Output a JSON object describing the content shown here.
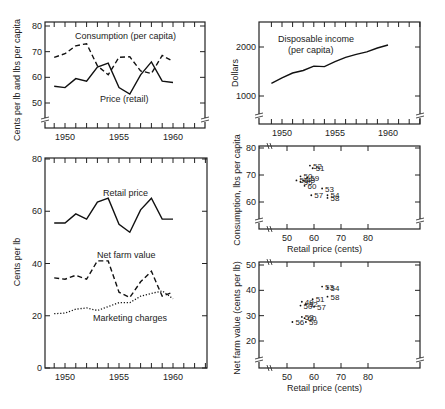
{
  "chart_data": [
    {
      "id": "consumption_price",
      "type": "line",
      "title": "",
      "xlabel": "",
      "ylabel": "Cents per lb and lbs per capita",
      "x": [
        1949,
        1950,
        1951,
        1952,
        1953,
        1954,
        1955,
        1956,
        1957,
        1958,
        1959,
        1960
      ],
      "xticks": [
        1950,
        1955,
        1960
      ],
      "yticks": [
        50,
        60,
        70,
        80
      ],
      "ylim": [
        40,
        80
      ],
      "xlim": [
        1948,
        1963
      ],
      "series": [
        {
          "name": "Consumption (per capita)",
          "style": "dashed",
          "values": [
            67.8,
            69.2,
            72.3,
            73.1,
            64.5,
            61.0,
            67.8,
            68.0,
            62.5,
            61.5,
            68.5,
            66.2
          ]
        },
        {
          "name": "Price (retail)",
          "style": "solid",
          "values": [
            56.5,
            56.0,
            59.5,
            58.5,
            64.0,
            65.5,
            56.0,
            53.5,
            61.0,
            66.0,
            58.5,
            58.0
          ]
        }
      ],
      "annotations": [
        "Consumption (per capita)",
        "Price (retail)"
      ]
    },
    {
      "id": "disposable_income",
      "type": "line",
      "title": "",
      "xlabel": "",
      "ylabel": "Dollars",
      "x": [
        1949,
        1950,
        1951,
        1952,
        1953,
        1954,
        1955,
        1956,
        1957,
        1958,
        1959,
        1960
      ],
      "xticks": [
        1950,
        1955,
        1960
      ],
      "yticks": [
        1000,
        2000
      ],
      "ylim": [
        500,
        2500
      ],
      "xlim": [
        1948,
        1963
      ],
      "series": [
        {
          "name": "Disposable income (per capita)",
          "style": "solid",
          "values": [
            1260,
            1370,
            1470,
            1520,
            1610,
            1600,
            1700,
            1790,
            1850,
            1900,
            1980,
            2040
          ]
        }
      ],
      "annotations": [
        "Disposable income",
        "(per capita)"
      ]
    },
    {
      "id": "price_spread",
      "type": "line",
      "title": "",
      "xlabel": "",
      "ylabel": "Cents per lb",
      "x": [
        1949,
        1950,
        1951,
        1952,
        1953,
        1954,
        1955,
        1956,
        1957,
        1958,
        1959,
        1960
      ],
      "xticks": [
        1950,
        1955,
        1960
      ],
      "yticks": [
        0,
        20,
        40,
        60,
        80
      ],
      "ylim": [
        0,
        80
      ],
      "xlim": [
        1948,
        1963
      ],
      "series": [
        {
          "name": "Retail price",
          "style": "solid",
          "values": [
            55.5,
            55.5,
            59.0,
            57.0,
            63.5,
            65.0,
            55.0,
            52.0,
            60.5,
            65.0,
            57.0,
            57.0
          ]
        },
        {
          "name": "Net farm value",
          "style": "dashed",
          "values": [
            34.5,
            34.0,
            35.5,
            34.0,
            41.0,
            41.0,
            29.0,
            27.0,
            33.0,
            37.0,
            27.5,
            29.0
          ]
        },
        {
          "name": "Marketing charges",
          "style": "dotted",
          "values": [
            20.8,
            21.0,
            22.5,
            23.0,
            22.0,
            23.5,
            25.0,
            25.0,
            27.5,
            28.5,
            29.5,
            26.5
          ]
        }
      ],
      "annotations": [
        "Retail price",
        "Net farm value",
        "Marketing charges"
      ]
    },
    {
      "id": "consumption_vs_price",
      "type": "scatter",
      "title": "",
      "xlabel": "Retail price (cents)",
      "ylabel": "Consumption, lbs per capita",
      "xticks": [
        50,
        60,
        70,
        80
      ],
      "yticks": [
        60,
        70,
        80
      ],
      "xlim": [
        40,
        100
      ],
      "ylim": [
        50,
        80
      ],
      "points": [
        {
          "label": "49",
          "x": 56.0,
          "y": 68.0
        },
        {
          "label": "50",
          "x": 55.0,
          "y": 69.5
        },
        {
          "label": "51",
          "x": 59.5,
          "y": 72.5
        },
        {
          "label": "52",
          "x": 58.5,
          "y": 73.5
        },
        {
          "label": "53",
          "x": 63.0,
          "y": 65.0
        },
        {
          "label": "54",
          "x": 65.0,
          "y": 62.5
        },
        {
          "label": "55",
          "x": 55.0,
          "y": 67.5
        },
        {
          "label": "56",
          "x": 53.5,
          "y": 68.0
        },
        {
          "label": "57",
          "x": 59.0,
          "y": 62.5
        },
        {
          "label": "58",
          "x": 65.0,
          "y": 61.5
        },
        {
          "label": "59",
          "x": 57.5,
          "y": 69.0
        },
        {
          "label": "60",
          "x": 56.5,
          "y": 66.0
        }
      ]
    },
    {
      "id": "farmvalue_vs_price",
      "type": "scatter",
      "title": "",
      "xlabel": "Retail price (cents)",
      "ylabel": "Net farm value (cents per lb)",
      "xticks": [
        50,
        60,
        70,
        80
      ],
      "yticks": [
        20,
        30,
        40,
        50
      ],
      "xlim": [
        40,
        100
      ],
      "ylim": [
        10,
        50
      ],
      "points": [
        {
          "label": "49",
          "x": 55.5,
          "y": 35.5
        },
        {
          "label": "50",
          "x": 55.0,
          "y": 34.0
        },
        {
          "label": "51",
          "x": 59.5,
          "y": 36.5
        },
        {
          "label": "52",
          "x": 57.0,
          "y": 34.5
        },
        {
          "label": "53",
          "x": 63.0,
          "y": 41.5
        },
        {
          "label": "54",
          "x": 65.0,
          "y": 41.0
        },
        {
          "label": "56",
          "x": 52.0,
          "y": 27.5
        },
        {
          "label": "57",
          "x": 60.0,
          "y": 33.5
        },
        {
          "label": "58",
          "x": 65.0,
          "y": 37.5
        },
        {
          "label": "59",
          "x": 57.0,
          "y": 27.5
        },
        {
          "label": "60",
          "x": 56.5,
          "y": 29.0
        },
        {
          "label": "53b",
          "x": 55.5,
          "y": 29.5
        }
      ]
    }
  ]
}
